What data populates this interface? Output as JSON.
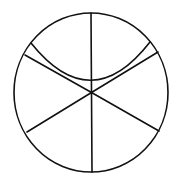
{
  "diagram": {
    "width": 177,
    "height": 181,
    "background": "#ffffff",
    "stroke_color": "#111111",
    "stroke_width": 1.6,
    "circle": {
      "cx": 91,
      "cy": 92.5,
      "rx": 77,
      "ry": 79.5
    },
    "radial_lines": [
      {
        "id": "top",
        "x1": 91.5,
        "y1": 92.5,
        "x2": 91,
        "y2": 13
      },
      {
        "id": "bottom",
        "x1": 91.5,
        "y1": 92.5,
        "x2": 92,
        "y2": 172
      },
      {
        "id": "upper-left",
        "x1": 91.5,
        "y1": 92.5,
        "x2": 25,
        "y2": 55
      },
      {
        "id": "upper-right",
        "x1": 91.5,
        "y1": 92.5,
        "x2": 158,
        "y2": 52
      },
      {
        "id": "lower-left",
        "x1": 91.5,
        "y1": 92.5,
        "x2": 27,
        "y2": 132
      },
      {
        "id": "lower-right",
        "x1": 91.5,
        "y1": 92.5,
        "x2": 159,
        "y2": 131
      }
    ],
    "curve": {
      "path": "M 31 43 Q 91 118 150 42"
    }
  }
}
